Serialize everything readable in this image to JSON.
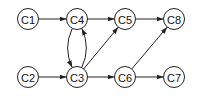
{
  "diagram": {
    "type": "directed-graph",
    "nodes": [
      {
        "id": "C1",
        "label": "C1",
        "x": 28,
        "y": 19
      },
      {
        "id": "C4",
        "label": "C4",
        "x": 77,
        "y": 19
      },
      {
        "id": "C5",
        "label": "C5",
        "x": 125,
        "y": 19
      },
      {
        "id": "C8",
        "label": "C8",
        "x": 174,
        "y": 19
      },
      {
        "id": "C2",
        "label": "C2",
        "x": 28,
        "y": 77
      },
      {
        "id": "C3",
        "label": "C3",
        "x": 77,
        "y": 77
      },
      {
        "id": "C6",
        "label": "C6",
        "x": 125,
        "y": 77
      },
      {
        "id": "C7",
        "label": "C7",
        "x": 174,
        "y": 77
      }
    ],
    "edges": [
      {
        "from": "C1",
        "to": "C4"
      },
      {
        "from": "C4",
        "to": "C5"
      },
      {
        "from": "C5",
        "to": "C8"
      },
      {
        "from": "C2",
        "to": "C3"
      },
      {
        "from": "C3",
        "to": "C6"
      },
      {
        "from": "C6",
        "to": "C7"
      },
      {
        "from": "C3",
        "to": "C5"
      },
      {
        "from": "C6",
        "to": "C8"
      },
      {
        "from": "C4",
        "to": "C3",
        "curve": "left"
      },
      {
        "from": "C3",
        "to": "C4",
        "curve": "right"
      }
    ]
  }
}
